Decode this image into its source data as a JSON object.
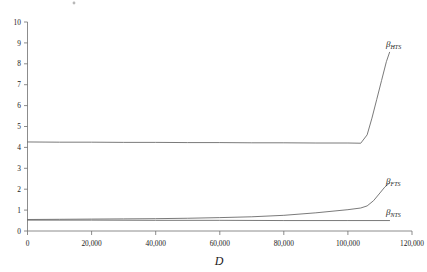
{
  "chart_data": {
    "type": "line",
    "title": "",
    "xlabel": "D",
    "ylabel": "",
    "xlim": [
      0,
      120000
    ],
    "ylim": [
      0,
      10
    ],
    "grid": false,
    "legend_position": "right-inline-labels",
    "xticks": [
      0,
      20000,
      40000,
      60000,
      80000,
      100000,
      120000
    ],
    "xticklabels": [
      "0",
      "20,000",
      "40,000",
      "60,000",
      "80,000",
      "100,000",
      "120,000"
    ],
    "yticks": [
      0,
      1,
      2,
      3,
      4,
      5,
      6,
      7,
      8,
      9,
      10
    ],
    "yticklabels": [
      "0",
      "1",
      "2",
      "3",
      "4",
      "5",
      "6",
      "7",
      "8",
      "9",
      "10"
    ],
    "series": [
      {
        "name": "beta_HTS",
        "label_base": "β",
        "label_sub": "HTS",
        "color": "#6b6b6b",
        "x": [
          0,
          10000,
          20000,
          30000,
          40000,
          50000,
          60000,
          70000,
          80000,
          90000,
          100000,
          104000,
          106000,
          107500,
          109000,
          110500,
          112000,
          113000
        ],
        "values": [
          4.26,
          4.25,
          4.25,
          4.24,
          4.24,
          4.23,
          4.23,
          4.22,
          4.22,
          4.21,
          4.21,
          4.2,
          4.6,
          5.4,
          6.3,
          7.2,
          8.1,
          8.55
        ]
      },
      {
        "name": "beta_FTS",
        "label_base": "β",
        "label_sub": "FTS",
        "color": "#6b6b6b",
        "x": [
          0,
          10000,
          20000,
          30000,
          40000,
          50000,
          60000,
          70000,
          80000,
          90000,
          100000,
          104000,
          106000,
          108000,
          110000,
          111500,
          113000
        ],
        "values": [
          0.55,
          0.56,
          0.57,
          0.58,
          0.59,
          0.61,
          0.64,
          0.68,
          0.75,
          0.87,
          1.02,
          1.1,
          1.2,
          1.45,
          1.82,
          2.1,
          2.3
        ]
      },
      {
        "name": "beta_NTS",
        "label_base": "β",
        "label_sub": "NTS",
        "color": "#6b6b6b",
        "x": [
          0,
          20000,
          40000,
          60000,
          80000,
          100000,
          113000
        ],
        "values": [
          0.52,
          0.52,
          0.51,
          0.51,
          0.5,
          0.5,
          0.5
        ]
      }
    ]
  }
}
